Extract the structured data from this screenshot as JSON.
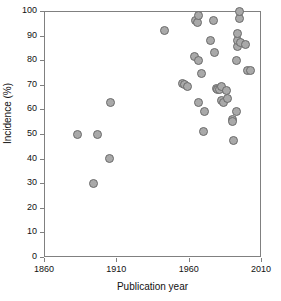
{
  "chart_data": {
    "type": "scatter",
    "title": "",
    "xlabel": "Publication year",
    "ylabel": "Incidence (%)",
    "xlim": [
      1860,
      2010
    ],
    "ylim": [
      0,
      100
    ],
    "xticks": [
      1860,
      1910,
      1960,
      2010
    ],
    "yticks": [
      0,
      10,
      20,
      30,
      40,
      50,
      60,
      70,
      80,
      90,
      100
    ],
    "grid": false,
    "legend": null,
    "marker": {
      "shape": "circle",
      "fill_color": "#a9a9a9",
      "edge_color": "#6b6b6b",
      "size_px": 9
    },
    "series": [
      {
        "name": "Studies",
        "points": [
          {
            "x": 1883,
            "y": 50
          },
          {
            "x": 1894,
            "y": 30
          },
          {
            "x": 1897,
            "y": 50
          },
          {
            "x": 1905,
            "y": 40
          },
          {
            "x": 1906,
            "y": 63
          },
          {
            "x": 1943,
            "y": 92
          },
          {
            "x": 1956,
            "y": 70.5
          },
          {
            "x": 1957,
            "y": 70
          },
          {
            "x": 1959,
            "y": 69.5
          },
          {
            "x": 1965,
            "y": 96
          },
          {
            "x": 1966,
            "y": 95.5
          },
          {
            "x": 1967,
            "y": 98
          },
          {
            "x": 1964,
            "y": 81.5
          },
          {
            "x": 1967,
            "y": 80
          },
          {
            "x": 1967,
            "y": 63
          },
          {
            "x": 1969,
            "y": 74.7
          },
          {
            "x": 1970,
            "y": 51
          },
          {
            "x": 1971,
            "y": 59
          },
          {
            "x": 1975,
            "y": 88
          },
          {
            "x": 1977,
            "y": 96
          },
          {
            "x": 1978,
            "y": 83
          },
          {
            "x": 1979,
            "y": 68.5
          },
          {
            "x": 1980,
            "y": 68
          },
          {
            "x": 1981,
            "y": 68.2
          },
          {
            "x": 1983,
            "y": 69.5
          },
          {
            "x": 1983,
            "y": 63.5
          },
          {
            "x": 1984,
            "y": 63
          },
          {
            "x": 1986,
            "y": 67.5
          },
          {
            "x": 1987,
            "y": 64.5
          },
          {
            "x": 1990,
            "y": 56
          },
          {
            "x": 1990,
            "y": 55
          },
          {
            "x": 1991,
            "y": 47.5
          },
          {
            "x": 1993,
            "y": 59
          },
          {
            "x": 1993,
            "y": 79.7
          },
          {
            "x": 1994,
            "y": 85.5
          },
          {
            "x": 1994,
            "y": 88
          },
          {
            "x": 1994,
            "y": 91
          },
          {
            "x": 1995,
            "y": 97
          },
          {
            "x": 1995,
            "y": 100
          },
          {
            "x": 1996,
            "y": 87
          },
          {
            "x": 1999,
            "y": 86.5
          },
          {
            "x": 2001,
            "y": 76
          },
          {
            "x": 2003,
            "y": 75.8
          }
        ]
      }
    ]
  },
  "axes": {
    "x_title": "Publication year",
    "y_title": "Incidence (%)",
    "x_tick_labels": [
      "1860",
      "1910",
      "1960",
      "2010"
    ],
    "y_tick_labels": [
      "0",
      "10",
      "20",
      "30",
      "40",
      "50",
      "60",
      "70",
      "80",
      "90",
      "100"
    ]
  },
  "colors": {
    "marker_fill": "#a9a9a9",
    "marker_edge": "#6b6b6b",
    "axis": "#808080",
    "text": "#111111",
    "background": "#ffffff"
  }
}
